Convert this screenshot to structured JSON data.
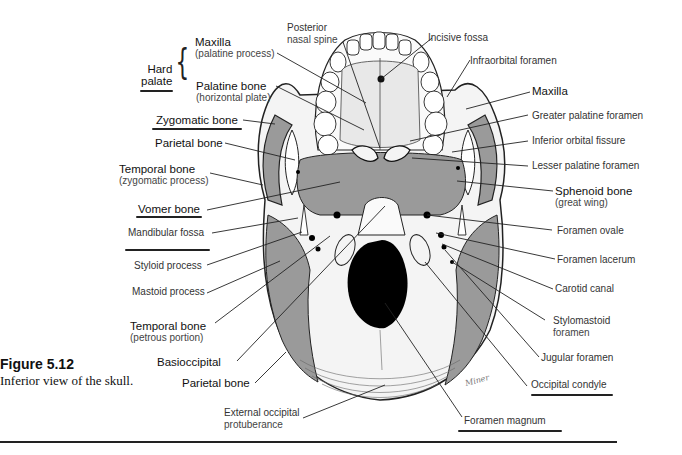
{
  "figure": {
    "number": "Figure 5.12",
    "caption": "Inferior view of the skull."
  },
  "group_label": {
    "text_line1": "Hard",
    "text_line2": "palate",
    "members": [
      "Maxilla (palatine process)",
      "Palatine bone (horizontal plate)"
    ]
  },
  "labels": {
    "maxilla_palatine": {
      "main": "Maxilla",
      "sub": "(palatine process)"
    },
    "palatine_horizontal": {
      "main": "Palatine bone",
      "sub": "(horizontal plate)"
    },
    "zygomatic": {
      "main": "Zygomatic bone"
    },
    "parietal_upper": {
      "main": "Parietal bone"
    },
    "temporal_zygomatic": {
      "main": "Temporal bone",
      "sub": "(zygomatic process)"
    },
    "vomer": {
      "main": "Vomer bone"
    },
    "mandibular_fossa": {
      "main": "Mandibular fossa"
    },
    "styloid": {
      "main": "Styloid process"
    },
    "mastoid": {
      "main": "Mastoid process"
    },
    "temporal_petrous": {
      "main": "Temporal bone",
      "sub": "(petrous portion)"
    },
    "basioccipital": {
      "main": "Basioccipital"
    },
    "parietal_lower": {
      "main": "Parietal bone"
    },
    "ext_occipital": {
      "main": "External occipital",
      "sub": "protuberance"
    },
    "posterior_nasal": {
      "main": "Posterior",
      "sub": "nasal spine"
    },
    "incisive_fossa": {
      "main": "Incisive fossa"
    },
    "infraorbital": {
      "main": "Infraorbital foramen"
    },
    "maxilla_right": {
      "main": "Maxilla"
    },
    "greater_palatine": {
      "main": "Greater palatine foramen"
    },
    "inferior_orbital": {
      "main": "Inferior orbital fissure"
    },
    "lesser_palatine": {
      "main": "Lesser palatine foramen"
    },
    "sphenoid": {
      "main": "Sphenoid bone",
      "sub": "(great wing)"
    },
    "foramen_ovale": {
      "main": "Foramen ovale"
    },
    "foramen_lacerum": {
      "main": "Foramen lacerum"
    },
    "carotid": {
      "main": "Carotid canal"
    },
    "stylomastoid": {
      "main": "Stylomastoid",
      "sub": "foramen"
    },
    "jugular": {
      "main": "Jugular foramen"
    },
    "occipital_condyle": {
      "main": "Occipital condyle"
    },
    "foramen_magnum": {
      "main": "Foramen magnum"
    }
  },
  "handwritten_underlines": [
    "Hard palate",
    "Zygomatic bone",
    "Vomer bone",
    "Mandibular fossa",
    "Occipital condyle",
    "Foramen magnum"
  ],
  "artist_signature": "Miner",
  "colors": {
    "bone_shade": "#9a9a9a",
    "bone_light": "#f4f4f4",
    "line": "#222222",
    "foramen": "#000000"
  }
}
